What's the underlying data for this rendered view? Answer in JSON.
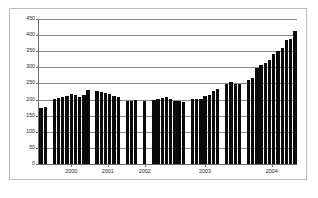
{
  "chart_data": {
    "type": "bar",
    "title": "",
    "subtitle": "",
    "xlabel": "",
    "ylabel": "",
    "ylim": [
      0,
      450
    ],
    "ytick_values": [
      450,
      400,
      350,
      300,
      250,
      200,
      150,
      100,
      50,
      0
    ],
    "ytick_labels": [
      "450",
      "400",
      "350",
      "300",
      "250",
      "200",
      "150",
      "100",
      "50",
      "0"
    ],
    "grid": true,
    "legend": null,
    "legend_position": "none",
    "bar_color": "#0a0a0a",
    "axis_color": "#6b6b6b",
    "gridline_color": "#8a8a8a",
    "frame_color": "#b9b9b9",
    "background_color": "#ffffff",
    "xtick_labels": [
      "2000",
      "2001",
      "2002",
      "2003",
      "2004"
    ],
    "groups": [
      {
        "label": "",
        "values": [
          175,
          178
        ]
      },
      {
        "label": "2000",
        "values": [
          203,
          204,
          208,
          212,
          216,
          213,
          209,
          214,
          231
        ]
      },
      {
        "label": "2001",
        "values": [
          227,
          224,
          220,
          217,
          211,
          207
        ]
      },
      {
        "label": "",
        "values": [
          196,
          196,
          200
        ]
      },
      {
        "label": "2002",
        "values": [
          196
        ]
      },
      {
        "label": "",
        "values": [
          200,
          203,
          204,
          208,
          203,
          196,
          195,
          192
        ]
      },
      {
        "label": "2003",
        "values": [
          203,
          201,
          203,
          210,
          214,
          227,
          233
        ]
      },
      {
        "label": "",
        "values": [
          247,
          254,
          248,
          248
        ]
      },
      {
        "label": "2004",
        "values": [
          261,
          268,
          299,
          307,
          314,
          323,
          342,
          351,
          361,
          386,
          388,
          412
        ]
      }
    ],
    "values": [
      175,
      178,
      203,
      204,
      208,
      212,
      216,
      213,
      209,
      214,
      231,
      227,
      224,
      220,
      217,
      211,
      207,
      196,
      196,
      200,
      196,
      200,
      203,
      204,
      208,
      203,
      196,
      195,
      192,
      203,
      201,
      203,
      210,
      214,
      227,
      233,
      247,
      254,
      248,
      248,
      261,
      268,
      299,
      307,
      314,
      323,
      342,
      351,
      361,
      386,
      388,
      412
    ]
  }
}
